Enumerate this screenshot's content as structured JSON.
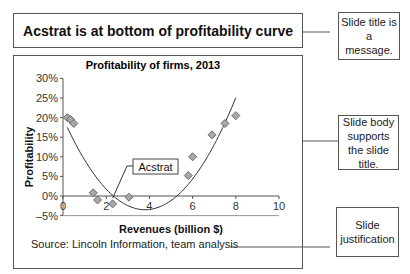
{
  "slide": {
    "title": "Acstrat is at bottom of profitability curve",
    "source": "Source: Lincoln Information, team analysis"
  },
  "annotations": {
    "title_note": "Slide title is a message.",
    "body_note": "Slide body supports the slide title.",
    "justification_note": "Slide justification"
  },
  "callout": {
    "label": "Acstrat",
    "point_index": 5
  },
  "colors": {
    "marker_fill": "#a8a8a8",
    "marker_stroke": "#6a6a6a",
    "curve": "#333333",
    "axis": "#555555",
    "border": "#555555"
  },
  "chart_data": {
    "type": "scatter",
    "title": "Profitability of firms, 2013",
    "xlabel": "Revenues (billion $)",
    "ylabel": "Profitability",
    "xlim": [
      0,
      10
    ],
    "ylim": [
      -5,
      30
    ],
    "x_ticks": [
      0,
      2,
      4,
      6,
      8,
      10
    ],
    "y_ticks": [
      "30%",
      "25%",
      "20%",
      "15%",
      "10%",
      "5%",
      "0%",
      "–5%"
    ],
    "y_tick_values": [
      30,
      25,
      20,
      15,
      10,
      5,
      0,
      -5
    ],
    "grid": false,
    "legend": "none",
    "series": [
      {
        "name": "Firms",
        "points": [
          {
            "x": 0.2,
            "y": 20.0
          },
          {
            "x": 0.35,
            "y": 19.5
          },
          {
            "x": 0.5,
            "y": 18.5
          },
          {
            "x": 1.4,
            "y": 0.8
          },
          {
            "x": 1.6,
            "y": -1.0
          },
          {
            "x": 2.3,
            "y": -2.0
          },
          {
            "x": 3.05,
            "y": -0.3
          },
          {
            "x": 5.8,
            "y": 5.2
          },
          {
            "x": 6.0,
            "y": 10.0
          },
          {
            "x": 6.9,
            "y": 15.6
          },
          {
            "x": 7.5,
            "y": 18.5
          },
          {
            "x": 8.0,
            "y": 20.5
          }
        ]
      }
    ],
    "trendline": {
      "type": "polynomial-2",
      "vertex": {
        "x": 3.8,
        "y": -3.5
      },
      "x_range": [
        0.2,
        8.0
      ],
      "a": 1.62
    },
    "annotations": [
      "Acstrat"
    ]
  }
}
